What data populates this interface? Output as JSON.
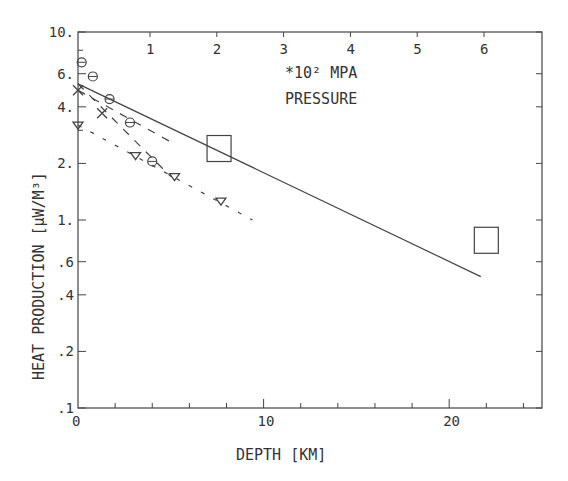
{
  "chart_data": {
    "type": "scatter",
    "title": "",
    "xlabel": "DEPTH [KM]",
    "ylabel": "HEAT PRODUCTION [µW/M³]",
    "top_axis_label_line1": "*10² MPA",
    "top_axis_label_line2": "PRESSURE",
    "xlim": [
      0,
      25
    ],
    "ylim": [
      0.1,
      10
    ],
    "yscale": "log",
    "grid": false,
    "x_tick_labels": [
      "0",
      "10",
      "20"
    ],
    "x_minor_tick_step": 2,
    "top_tick_labels": [
      "1",
      "2",
      "3",
      "4",
      "5",
      "6"
    ],
    "y_tick_labels": [
      "10.",
      "6.",
      "4.",
      "2.",
      "1.",
      ".6",
      ".4",
      ".2",
      ".1"
    ],
    "series": [
      {
        "name": "circles",
        "marker": "circle",
        "x": [
          0.2,
          0.8,
          1.7,
          2.8,
          4.0
        ],
        "y": [
          6.9,
          5.8,
          4.4,
          3.3,
          2.05
        ]
      },
      {
        "name": "crosses",
        "marker": "x",
        "x": [
          0.0,
          1.3
        ],
        "y": [
          4.9,
          3.7
        ]
      },
      {
        "name": "triangles",
        "marker": "triangle",
        "x": [
          0.0,
          3.1,
          5.2,
          7.7
        ],
        "y": [
          3.2,
          2.2,
          1.7,
          1.26
        ]
      },
      {
        "name": "squares",
        "marker": "square",
        "x": [
          7.6,
          22.0
        ],
        "y": [
          2.4,
          0.78
        ]
      },
      {
        "name": "solid fit",
        "style": "solid",
        "x": [
          0.0,
          21.7
        ],
        "y": [
          5.3,
          0.5
        ]
      },
      {
        "name": "dashed fit A",
        "style": "dashed",
        "x": [
          0.0,
          5.0
        ],
        "y": [
          5.3,
          1.7
        ]
      },
      {
        "name": "dashed fit B",
        "style": "dashed",
        "x": [
          0.0,
          5.0
        ],
        "y": [
          4.9,
          2.6
        ]
      },
      {
        "name": "dotted fit",
        "style": "dotted",
        "x": [
          0.0,
          9.4
        ],
        "y": [
          3.2,
          1.0
        ]
      }
    ]
  },
  "axes": {
    "x_label": "DEPTH [KM]",
    "y_label": "HEAT PRODUCTION [µW/M³]",
    "pressure_unit": "*10² MPA",
    "pressure_label": "PRESSURE"
  }
}
